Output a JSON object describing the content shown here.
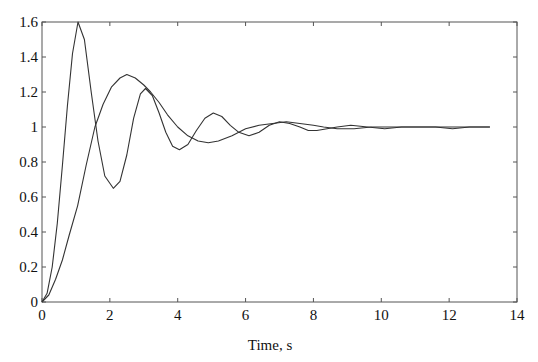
{
  "chart_data": {
    "type": "line",
    "title": "",
    "xlabel": "Time, s",
    "ylabel": "",
    "xlim": [
      0,
      14
    ],
    "ylim": [
      0,
      1.6
    ],
    "xticks": [
      0,
      2,
      4,
      6,
      8,
      10,
      12,
      14
    ],
    "yticks": [
      0,
      0.2,
      0.4,
      0.6,
      0.8,
      1,
      1.2,
      1.4,
      1.6
    ],
    "xtick_labels": [
      "0",
      "2",
      "4",
      "6",
      "8",
      "10",
      "12",
      "14"
    ],
    "ytick_labels": [
      "0",
      "0.2",
      "0.4",
      "0.6",
      "0.8",
      "1",
      "1.2",
      "1.4",
      "1.6"
    ],
    "grid": false,
    "legend": null,
    "series": [
      {
        "name": "response-1 (high overshoot)",
        "x": [
          0,
          0.15,
          0.3,
          0.45,
          0.6,
          0.75,
          0.9,
          1.06,
          1.25,
          1.45,
          1.65,
          1.85,
          2.1,
          2.3,
          2.5,
          2.7,
          2.9,
          3.05,
          3.25,
          3.45,
          3.65,
          3.85,
          4.05,
          4.3,
          4.55,
          4.8,
          5.05,
          5.3,
          5.55,
          5.8,
          6.1,
          6.4,
          6.7,
          7.0,
          7.3,
          7.6,
          7.85,
          8.1,
          8.4,
          8.7,
          9.1,
          9.6,
          10.1,
          10.6,
          11.1,
          11.6,
          12.1,
          12.6,
          13.2
        ],
        "y": [
          0,
          0.05,
          0.2,
          0.45,
          0.78,
          1.12,
          1.42,
          1.6,
          1.5,
          1.2,
          0.92,
          0.72,
          0.65,
          0.69,
          0.84,
          1.05,
          1.19,
          1.22,
          1.18,
          1.08,
          0.97,
          0.89,
          0.87,
          0.9,
          0.98,
          1.05,
          1.08,
          1.06,
          1.01,
          0.97,
          0.95,
          0.97,
          1.01,
          1.03,
          1.02,
          1.0,
          0.98,
          0.98,
          0.99,
          1.0,
          1.01,
          1.0,
          0.99,
          1.0,
          1.0,
          1.0,
          0.99,
          1.0,
          1.0
        ]
      },
      {
        "name": "response-2 (moderate overshoot)",
        "x": [
          0,
          0.2,
          0.4,
          0.6,
          0.8,
          1.05,
          1.3,
          1.56,
          1.8,
          2.05,
          2.3,
          2.5,
          2.75,
          3.0,
          3.2,
          3.45,
          3.7,
          4.0,
          4.3,
          4.6,
          4.9,
          5.2,
          5.6,
          6.0,
          6.4,
          6.8,
          7.2,
          7.6,
          8.0,
          8.3,
          8.7,
          9.2,
          9.7,
          10.2,
          10.7,
          11.2,
          11.7,
          12.2,
          12.7,
          13.2
        ],
        "y": [
          0,
          0.04,
          0.13,
          0.24,
          0.38,
          0.55,
          0.78,
          1.0,
          1.13,
          1.23,
          1.28,
          1.3,
          1.28,
          1.24,
          1.2,
          1.14,
          1.07,
          1.0,
          0.95,
          0.92,
          0.91,
          0.92,
          0.95,
          0.99,
          1.01,
          1.02,
          1.03,
          1.02,
          1.01,
          1.0,
          0.99,
          0.99,
          1.0,
          1.0,
          1.0,
          1.0,
          1.0,
          1.0,
          1.0,
          1.0
        ]
      }
    ]
  }
}
